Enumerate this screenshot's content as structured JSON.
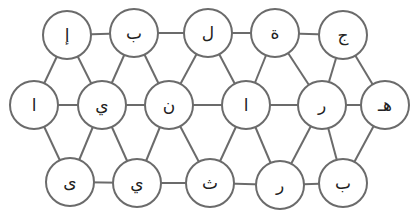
{
  "diagram": {
    "type": "letter-grid-graph",
    "node_radius": 24,
    "colors": {
      "stroke": "#6b6b6b",
      "fill": "#ffffff",
      "text": "#222222"
    },
    "nodes": [
      {
        "id": "t1",
        "row": "top",
        "x": 67,
        "y": 35,
        "label": "إ"
      },
      {
        "id": "t2",
        "row": "top",
        "x": 134,
        "y": 33,
        "label": "ب"
      },
      {
        "id": "t3",
        "row": "top",
        "x": 208,
        "y": 33,
        "label": "ل"
      },
      {
        "id": "t4",
        "row": "top",
        "x": 275,
        "y": 33,
        "label": "ة"
      },
      {
        "id": "t5",
        "row": "top",
        "x": 343,
        "y": 35,
        "label": "ج"
      },
      {
        "id": "m1",
        "row": "middle",
        "x": 34,
        "y": 105,
        "label": "ا"
      },
      {
        "id": "m2",
        "row": "middle",
        "x": 102,
        "y": 105,
        "label": "ي"
      },
      {
        "id": "m3",
        "row": "middle",
        "x": 169,
        "y": 105,
        "label": "ن"
      },
      {
        "id": "m4",
        "row": "middle",
        "x": 246,
        "y": 105,
        "label": "ا"
      },
      {
        "id": "m5",
        "row": "middle",
        "x": 322,
        "y": 105,
        "label": "ر"
      },
      {
        "id": "m6",
        "row": "middle",
        "x": 385,
        "y": 105,
        "label": "هـ"
      },
      {
        "id": "b1",
        "row": "bottom",
        "x": 70,
        "y": 182,
        "label": "ى"
      },
      {
        "id": "b2",
        "row": "bottom",
        "x": 137,
        "y": 183,
        "label": "ي"
      },
      {
        "id": "b3",
        "row": "bottom",
        "x": 210,
        "y": 183,
        "label": "ث"
      },
      {
        "id": "b4",
        "row": "bottom",
        "x": 280,
        "y": 185,
        "label": "ر"
      },
      {
        "id": "b5",
        "row": "bottom",
        "x": 343,
        "y": 183,
        "label": "ب"
      }
    ],
    "edges": [
      [
        "t1",
        "t2"
      ],
      [
        "t2",
        "t3"
      ],
      [
        "t3",
        "t4"
      ],
      [
        "t4",
        "t5"
      ],
      [
        "m1",
        "m2"
      ],
      [
        "m2",
        "m3"
      ],
      [
        "m3",
        "m4"
      ],
      [
        "m4",
        "m5"
      ],
      [
        "m5",
        "m6"
      ],
      [
        "b1",
        "b2"
      ],
      [
        "b2",
        "b3"
      ],
      [
        "b3",
        "b4"
      ],
      [
        "b4",
        "b5"
      ],
      [
        "t1",
        "m1"
      ],
      [
        "t1",
        "m2"
      ],
      [
        "t2",
        "m2"
      ],
      [
        "t2",
        "m3"
      ],
      [
        "t3",
        "m3"
      ],
      [
        "t3",
        "m4"
      ],
      [
        "t4",
        "m4"
      ],
      [
        "t4",
        "m5"
      ],
      [
        "t5",
        "m5"
      ],
      [
        "t5",
        "m6"
      ],
      [
        "m1",
        "b1"
      ],
      [
        "m2",
        "b1"
      ],
      [
        "m2",
        "b2"
      ],
      [
        "m3",
        "b2"
      ],
      [
        "m3",
        "b3"
      ],
      [
        "m4",
        "b3"
      ],
      [
        "m4",
        "b4"
      ],
      [
        "m5",
        "b4"
      ],
      [
        "m5",
        "b5"
      ],
      [
        "m6",
        "b5"
      ]
    ]
  }
}
